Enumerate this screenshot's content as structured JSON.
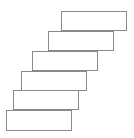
{
  "diagram": {
    "type": "staircase-stacked-rectangles",
    "stroke_color": "#8a8a8a",
    "fill_color": "#ffffff",
    "stroke_width": 1,
    "blocks": [
      {
        "x": 61,
        "y": 11,
        "w": 66,
        "h": 20
      },
      {
        "x": 48,
        "y": 31,
        "w": 66,
        "h": 20
      },
      {
        "x": 32,
        "y": 51,
        "w": 66,
        "h": 20
      },
      {
        "x": 21,
        "y": 71,
        "w": 66,
        "h": 20
      },
      {
        "x": 13,
        "y": 90,
        "w": 66,
        "h": 20
      },
      {
        "x": 6,
        "y": 110,
        "w": 66,
        "h": 21
      }
    ]
  }
}
